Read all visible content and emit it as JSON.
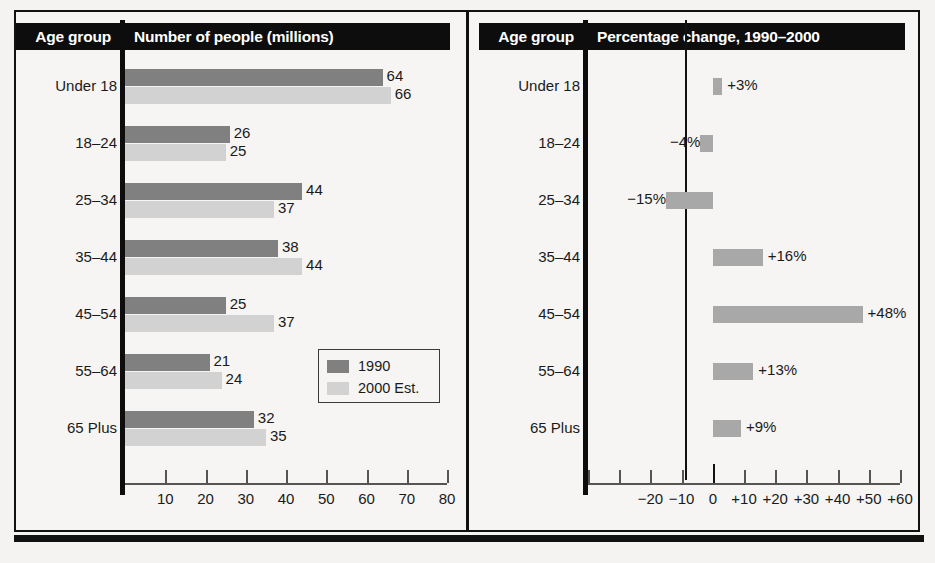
{
  "charts": {
    "left": {
      "age_header": "Age group",
      "title": "Number of people (millions)",
      "axis_ticks": [
        "10",
        "20",
        "30",
        "40",
        "50",
        "60",
        "70",
        "80"
      ],
      "legend": [
        {
          "label": "1990",
          "color": "#808080"
        },
        {
          "label": "2000 Est.",
          "color": "#d2d2d2"
        }
      ]
    },
    "right": {
      "age_header": "Age group",
      "title": "Percentage change, 1990–2000",
      "axis_ticks": [
        "−20",
        "−10",
        "0",
        "+10",
        "+20",
        "+30",
        "+40",
        "+50",
        "+60"
      ]
    }
  },
  "chart_data": [
    {
      "type": "bar",
      "title": "Number of people (millions)",
      "orientation": "horizontal",
      "xlabel": "",
      "ylabel": "Age group",
      "xlim": [
        0,
        80
      ],
      "grid": false,
      "legend_position": "inside-right",
      "categories": [
        "Under 18",
        "18–24",
        "25–34",
        "35–44",
        "45–54",
        "55–64",
        "65 Plus"
      ],
      "series": [
        {
          "name": "1990",
          "color": "#808080",
          "values": [
            64,
            26,
            44,
            38,
            25,
            21,
            32
          ],
          "labels": [
            "64",
            "26",
            "44",
            "38",
            "25",
            "21",
            "32"
          ]
        },
        {
          "name": "2000 Est.",
          "color": "#d2d2d2",
          "values": [
            66,
            25,
            37,
            44,
            37,
            24,
            35
          ],
          "labels": [
            "66",
            "25",
            "37",
            "44",
            "37",
            "24",
            "35"
          ]
        }
      ],
      "tick_labels": [
        "10",
        "20",
        "30",
        "40",
        "50",
        "60",
        "70",
        "80"
      ],
      "tick_values": [
        10,
        20,
        30,
        40,
        50,
        60,
        70,
        80
      ]
    },
    {
      "type": "bar",
      "title": "Percentage change, 1990–2000",
      "orientation": "horizontal",
      "xlabel": "",
      "ylabel": "Age group",
      "xlim": [
        -40,
        60
      ],
      "grid": false,
      "legend_position": "none",
      "categories": [
        "Under 18",
        "18–24",
        "25–34",
        "35–44",
        "45–54",
        "55–64",
        "65 Plus"
      ],
      "series": [
        {
          "name": "Percentage change 1990–2000",
          "color": "#a8a8a8",
          "values": [
            3,
            -4,
            -15,
            16,
            48,
            13,
            9
          ],
          "labels": [
            "+3%",
            "−4%",
            "−15%",
            "+16%",
            "+48%",
            "+13%",
            "+9%"
          ]
        }
      ],
      "tick_labels": [
        "−40",
        "−30",
        "−20",
        "−10",
        "0",
        "+10",
        "+20",
        "+30",
        "+40",
        "+50",
        "+60"
      ],
      "tick_values": [
        -40,
        -30,
        -20,
        -10,
        0,
        10,
        20,
        30,
        40,
        50,
        60
      ],
      "labeled_ticks": [
        "−20",
        "−10",
        "0",
        "+10",
        "+20",
        "+30",
        "+40",
        "+50",
        "+60"
      ]
    }
  ]
}
